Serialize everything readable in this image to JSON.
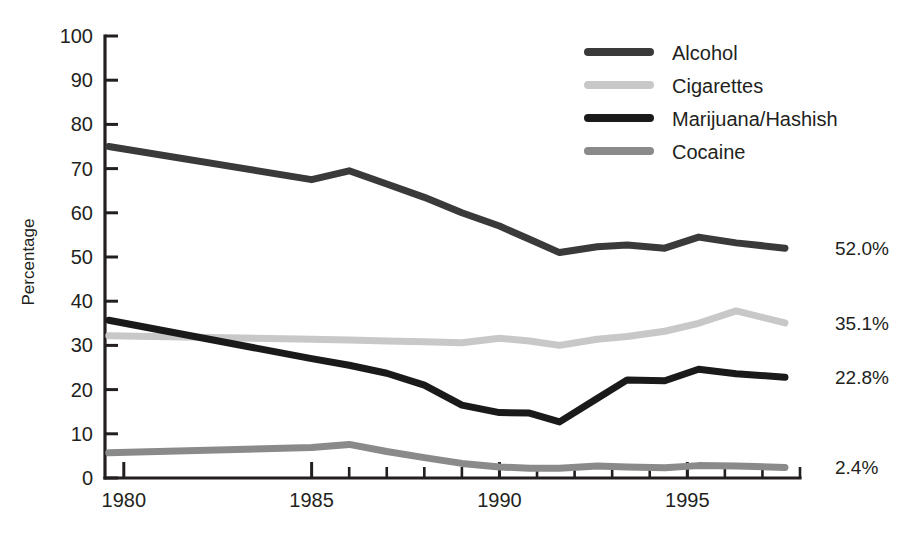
{
  "chart_data": {
    "type": "line",
    "title": "",
    "xlabel": "",
    "ylabel": "Percentage",
    "xlim": [
      1979.5,
      1998
    ],
    "ylim": [
      0,
      100
    ],
    "grid": false,
    "legend_position": "top-right",
    "y_ticks": [
      0,
      10,
      20,
      30,
      40,
      50,
      60,
      70,
      80,
      90,
      100
    ],
    "y_tick_labels": [
      "0",
      "10",
      "20",
      "30",
      "40",
      "50",
      "60",
      "70",
      "80",
      "90",
      "100"
    ],
    "x_ticks": [
      1980,
      1985,
      1990,
      1995
    ],
    "x_tick_labels": [
      "1980",
      "1985",
      "1990",
      "1995"
    ],
    "x_minor_ticks": [
      1986,
      1987,
      1988,
      1989,
      1990,
      1991,
      1992,
      1993,
      1994,
      1995,
      1996,
      1997
    ],
    "x": [
      1979.6,
      1985,
      1986,
      1987,
      1988,
      1989,
      1990,
      1990.8,
      1991.6,
      1992.6,
      1993.4,
      1994.4,
      1995.3,
      1996.3,
      1997.6
    ],
    "series": [
      {
        "name": "Alcohol",
        "color": "#3a3a3a",
        "width": 7,
        "end_label": "52.0%",
        "values": [
          75.0,
          67.5,
          69.5,
          66.5,
          63.5,
          60.0,
          57.0,
          54.0,
          51.0,
          52.3,
          52.7,
          52.0,
          54.5,
          53.2,
          52.0
        ]
      },
      {
        "name": "Cigarettes",
        "color": "#c8c8c8",
        "width": 7,
        "end_label": "35.1%",
        "values": [
          32.2,
          31.4,
          31.2,
          31.0,
          30.8,
          30.6,
          31.6,
          31.0,
          30.0,
          31.4,
          32.0,
          33.2,
          35.0,
          37.8,
          35.1
        ]
      },
      {
        "name": "Marijuana/Hashish",
        "color": "#1a1a1a",
        "width": 7,
        "end_label": "22.8%",
        "values": [
          35.7,
          27.0,
          25.5,
          23.7,
          21.0,
          16.5,
          14.8,
          14.7,
          12.7,
          18.0,
          22.2,
          22.0,
          24.6,
          23.6,
          22.8
        ]
      },
      {
        "name": "Cocaine",
        "color": "#8a8a8a",
        "width": 7,
        "end_label": "2.4%",
        "values": [
          5.7,
          6.9,
          7.6,
          6.0,
          4.6,
          3.3,
          2.5,
          2.2,
          2.2,
          2.7,
          2.5,
          2.3,
          2.8,
          2.7,
          2.4
        ]
      }
    ]
  },
  "legend": {
    "items": [
      {
        "label": "Alcohol",
        "color": "#3a3a3a"
      },
      {
        "label": "Cigarettes",
        "color": "#c8c8c8"
      },
      {
        "label": "Marijuana/Hashish",
        "color": "#1a1a1a"
      },
      {
        "label": "Cocaine",
        "color": "#8a8a8a"
      }
    ]
  },
  "axis": {
    "y_title": "Percentage"
  }
}
